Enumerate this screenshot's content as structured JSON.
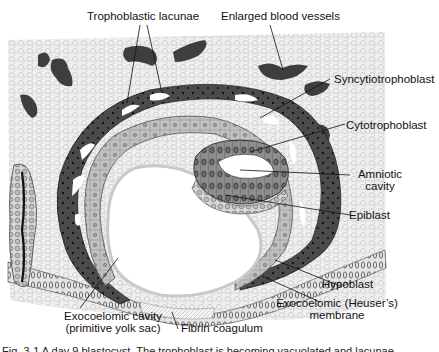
{
  "figure": {
    "type": "histology illustration",
    "colors": {
      "background": "#ffffff",
      "stroma": "#e6e6e6",
      "stroma_cells": "#c8c8c8",
      "syncytiotrophoblast": "#4a4a4a",
      "cytotrophoblast": "#bdbdbd",
      "epiblast": "#8c8c8c",
      "hypoblast": "#d0d0d0",
      "vessel": "#3e3e3e",
      "cavity": "#ffffff"
    }
  },
  "labels": {
    "trophoblastic_lacunae": "Trophoblastic lacunae",
    "enlarged_blood_vessels": "Enlarged blood vessels",
    "syncytiotrophoblast": "Syncytiotrophoblast",
    "cytotrophoblast": "Cytotrophoblast",
    "amniotic_cavity_line1": "Amniotic",
    "amniotic_cavity_line2": "cavity",
    "epiblast": "Epiblast",
    "hypoblast": "Hypoblast",
    "exocoelomic_membrane_line1": "Exocoelomic (Heuser’s)",
    "exocoelomic_membrane_line2": "membrane",
    "exocoelomic_cavity_line1": "Exocoelomic cavity",
    "exocoelomic_cavity_line2": "(primitive yolk sac)",
    "fibrin_coagulum": "Fibrin coagulum"
  },
  "caption": {
    "text": "Fig. 3-1  A day 9 blastocyst. The trophoblast is becoming vacuolated and lacunae"
  }
}
